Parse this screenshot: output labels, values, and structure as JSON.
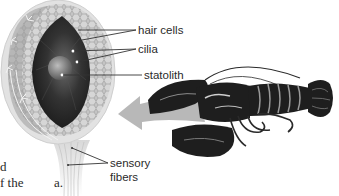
{
  "figure": {
    "panel_label": "a.",
    "labels": {
      "hair_cells": "hair cells",
      "cilia": "cilia",
      "statolith": "statolith",
      "sensory_fibers_line1": "sensory",
      "sensory_fibers_line2": "fibers"
    },
    "body_text_fragments": [
      "d",
      "f the"
    ],
    "colors": {
      "background": "#ffffff",
      "arrow": "#b8b8b8",
      "chamber_dark": "#2b2b2b",
      "wall": "#a9a9a9",
      "outer_capsule": "#d9d9d9",
      "lobster": "#1e1e1e",
      "leader_line": "#333333"
    }
  }
}
